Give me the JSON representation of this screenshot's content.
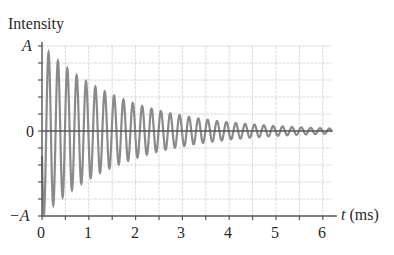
{
  "chart_data": {
    "type": "line",
    "title": "",
    "ylabel": "Intensity",
    "xlabel": "t (ms)",
    "xlabel_var": "t",
    "xlabel_unit": "(ms)",
    "x_ticks": [
      0,
      1,
      2,
      3,
      4,
      5,
      6
    ],
    "x_tick_labels": [
      "0",
      "1",
      "2",
      "3",
      "4",
      "5",
      "6"
    ],
    "x_minor_step": 0.5,
    "y_ticks": [
      -1,
      0,
      1
    ],
    "y_tick_labels": [
      "−A",
      "0",
      "A"
    ],
    "y_minor_step": 0.2,
    "xlim": [
      0,
      6.2
    ],
    "ylim": [
      -1,
      1
    ],
    "grid": true,
    "legend": null,
    "series": [
      {
        "name": "Damped oscillation",
        "description": "Exponentially decaying sinusoid: y = A·e^(-t/τ)·sin(2πft)",
        "frequency_khz": 5.0,
        "period_ms": 0.2,
        "decay_time_ms": 1.75,
        "initial_amplitude": 1.0,
        "t_start": 0,
        "t_end": 6.2,
        "envelope_samples": {
          "t": [
            0.2,
            1.0,
            2.0,
            3.0,
            4.0,
            5.0,
            6.0
          ],
          "amplitude": [
            0.89,
            0.56,
            0.32,
            0.18,
            0.1,
            0.06,
            0.03
          ]
        },
        "color": "#8a8a8a"
      }
    ]
  },
  "colors": {
    "axis": "#555555",
    "grid": "#d8d8d8",
    "curve": "#8a8a8a",
    "zero_line": "#555555"
  }
}
